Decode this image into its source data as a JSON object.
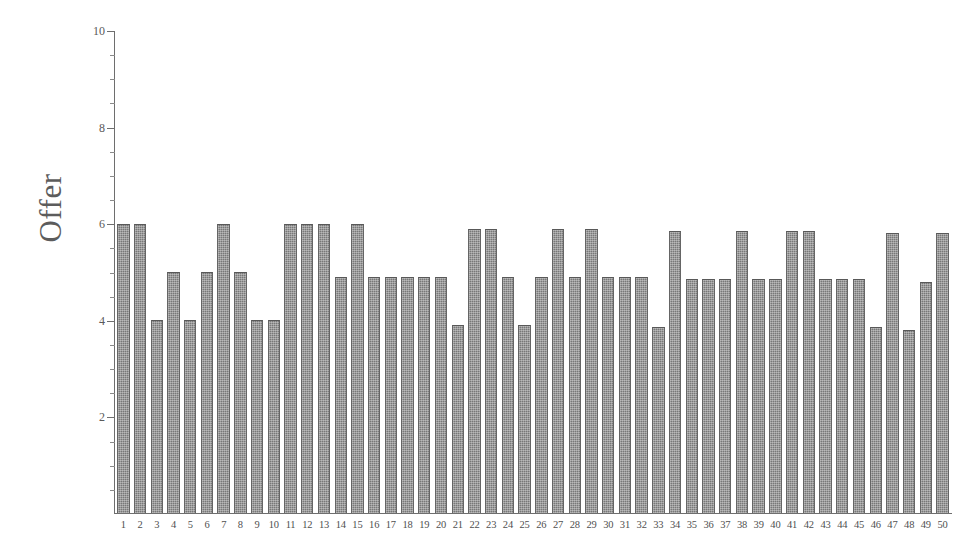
{
  "chart_data": {
    "type": "bar",
    "title": "",
    "subtitle": "",
    "xlabel": "",
    "ylabel": "Offer",
    "ylim": [
      0,
      10
    ],
    "y_major_ticks": [
      2,
      4,
      6,
      8,
      10
    ],
    "y_minor_tick_step": 0.5,
    "grid": false,
    "legend": null,
    "legend_position": "none",
    "bar_color": "#787878",
    "axis_color": "#6e6e6e",
    "background_color": "#ffffff",
    "categories": [
      "1",
      "2",
      "3",
      "4",
      "5",
      "6",
      "7",
      "8",
      "9",
      "10",
      "11",
      "12",
      "13",
      "14",
      "15",
      "16",
      "17",
      "18",
      "19",
      "20",
      "21",
      "22",
      "23",
      "24",
      "25",
      "26",
      "27",
      "28",
      "29",
      "30",
      "31",
      "32",
      "33",
      "34",
      "35",
      "36",
      "37",
      "38",
      "39",
      "40",
      "41",
      "42",
      "43",
      "44",
      "45",
      "46",
      "47",
      "48",
      "49",
      "50"
    ],
    "values": [
      6.0,
      6.0,
      4.0,
      5.0,
      4.0,
      5.0,
      6.0,
      5.0,
      4.0,
      4.0,
      6.0,
      6.0,
      6.0,
      4.9,
      6.0,
      4.9,
      4.9,
      4.9,
      4.9,
      4.9,
      3.9,
      5.9,
      5.9,
      4.9,
      3.9,
      4.9,
      5.9,
      4.9,
      5.9,
      4.9,
      4.9,
      4.9,
      3.85,
      5.85,
      4.85,
      4.85,
      4.85,
      5.85,
      4.85,
      4.85,
      5.85,
      5.85,
      4.85,
      4.85,
      4.85,
      3.85,
      5.8,
      3.8,
      4.8,
      5.8
    ]
  },
  "yaxis": {
    "label": "Offer",
    "major_labels": [
      "10",
      "8",
      "6",
      "4",
      "2"
    ],
    "major_values": [
      10,
      8,
      6,
      4,
      2
    ]
  }
}
